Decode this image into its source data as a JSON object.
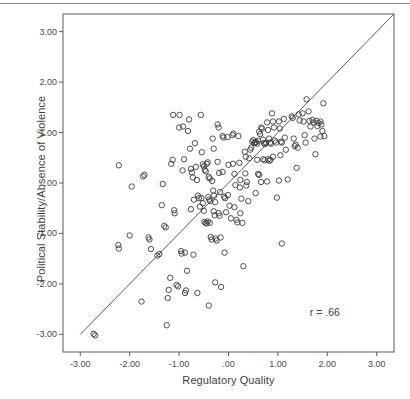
{
  "figure": {
    "background_color": "#ffffff",
    "frame_color": "#5a5a5a",
    "marker_color": "#3c3c3c",
    "line_color": "#4a4a4a",
    "top_rule": true
  },
  "chart_data": {
    "type": "scatter",
    "title": "",
    "xlabel": "Regulatory Quality",
    "ylabel": "Political Stability/Absence of Violence",
    "xlim": [
      -3.35,
      3.35
    ],
    "ylim": [
      -3.35,
      3.35
    ],
    "grid": false,
    "legend": null,
    "xticks": [
      -3.0,
      -2.0,
      -1.0,
      0.0,
      1.0,
      2.0,
      3.0
    ],
    "xticklabels": [
      "-3.00",
      "-2.00",
      "-1.00",
      ".00",
      "1.00",
      "2.00",
      "3.00"
    ],
    "yticks": [
      -3.0,
      -2.0,
      -1.0,
      0.0,
      1.0,
      2.0,
      3.0
    ],
    "yticklabels": [
      "-3.00",
      "-2.00",
      "-1.00",
      ".00",
      "1.00",
      "2.00",
      "3.00"
    ],
    "annotations": [
      {
        "text": "r = .66",
        "x": 1.95,
        "y": -2.55
      }
    ],
    "fit_line": {
      "type": "linear",
      "slope": 1.0,
      "intercept": 0.0,
      "x_start": -3.0,
      "y_start": -3.0,
      "x_end": 3.35,
      "y_end": 3.35
    },
    "marker": {
      "shape": "circle",
      "filled": false,
      "radius_px": 2.7
    },
    "points": [
      [
        -2.73,
        -2.99
      ],
      [
        -2.7,
        -3.02
      ],
      [
        -2.22,
        0.35
      ],
      [
        -1.96,
        -0.07
      ],
      [
        -2.23,
        -1.23
      ],
      [
        -2.22,
        -1.3
      ],
      [
        -2.0,
        -1.04
      ],
      [
        -1.76,
        -2.35
      ],
      [
        -1.73,
        0.13
      ],
      [
        -1.7,
        0.16
      ],
      [
        -1.62,
        -1.08
      ],
      [
        -1.6,
        -1.12
      ],
      [
        -1.57,
        -1.31
      ],
      [
        -1.44,
        -1.44
      ],
      [
        -1.4,
        -1.41
      ],
      [
        -1.33,
        -0.02
      ],
      [
        -1.35,
        -0.44
      ],
      [
        -1.3,
        -0.85
      ],
      [
        -1.27,
        -0.88
      ],
      [
        -1.25,
        -2.82
      ],
      [
        -1.21,
        -2.12
      ],
      [
        -1.23,
        -2.28
      ],
      [
        -1.16,
        0.38
      ],
      [
        -1.13,
        0.46
      ],
      [
        -1.1,
        -0.54
      ],
      [
        -1.09,
        -0.6
      ],
      [
        -1.12,
        1.35
      ],
      [
        -1.18,
        -1.88
      ],
      [
        -1.05,
        -2.02
      ],
      [
        -1.02,
        -2.05
      ],
      [
        -0.99,
        1.35
      ],
      [
        -1.0,
        1.1
      ],
      [
        -0.96,
        -1.35
      ],
      [
        -0.95,
        -1.4
      ],
      [
        -0.92,
        1.12
      ],
      [
        -0.9,
        0.47
      ],
      [
        -0.93,
        0.25
      ],
      [
        -0.88,
        -1.38
      ],
      [
        -0.86,
        -2.13
      ],
      [
        -0.88,
        -2.18
      ],
      [
        -0.84,
        -1.74
      ],
      [
        -0.8,
        1.26
      ],
      [
        -0.82,
        1.03
      ],
      [
        -0.78,
        0.68
      ],
      [
        -0.76,
        0.28
      ],
      [
        -0.74,
        0.21
      ],
      [
        -0.72,
        0.11
      ],
      [
        -0.7,
        -0.33
      ],
      [
        -0.76,
        -0.52
      ],
      [
        -0.71,
        -1.42
      ],
      [
        -0.68,
        0.79
      ],
      [
        -0.66,
        0.32
      ],
      [
        -0.64,
        0.06
      ],
      [
        -0.62,
        -0.25
      ],
      [
        -0.6,
        -0.3
      ],
      [
        -0.58,
        -0.47
      ],
      [
        -0.63,
        -2.18
      ],
      [
        -0.56,
        1.35
      ],
      [
        -0.54,
        0.61
      ],
      [
        -0.52,
        0.37
      ],
      [
        -0.5,
        0.33
      ],
      [
        -0.48,
        0.26
      ],
      [
        -0.46,
        0.23
      ],
      [
        -0.55,
        -0.3
      ],
      [
        -0.52,
        -0.4
      ],
      [
        -0.5,
        -0.55
      ],
      [
        -0.49,
        -0.77
      ],
      [
        -0.46,
        -0.79
      ],
      [
        -0.44,
        -0.8
      ],
      [
        -0.42,
        0.41
      ],
      [
        -0.44,
        0.38
      ],
      [
        -0.4,
        0.12
      ],
      [
        -0.38,
        0.09
      ],
      [
        -0.41,
        -0.28
      ],
      [
        -0.39,
        -0.33
      ],
      [
        -0.37,
        -0.36
      ],
      [
        -0.42,
        -0.76
      ],
      [
        -0.38,
        -0.79
      ],
      [
        -0.36,
        -1.07
      ],
      [
        -0.34,
        -1.12
      ],
      [
        -0.4,
        -2.43
      ],
      [
        -0.32,
        0.88
      ],
      [
        -0.3,
        0.68
      ],
      [
        -0.33,
        0.04
      ],
      [
        -0.31,
        -0.15
      ],
      [
        -0.29,
        -0.25
      ],
      [
        -0.27,
        -0.38
      ],
      [
        -0.3,
        -0.56
      ],
      [
        -0.28,
        -0.64
      ],
      [
        -0.26,
        -1.1
      ],
      [
        -0.24,
        -1.14
      ],
      [
        -0.27,
        -1.97
      ],
      [
        -0.22,
        1.16
      ],
      [
        -0.2,
        1.1
      ],
      [
        -0.22,
        0.42
      ],
      [
        -0.19,
        0.2
      ],
      [
        -0.17,
        -0.18
      ],
      [
        -0.2,
        -0.6
      ],
      [
        -0.18,
        -0.65
      ],
      [
        -0.16,
        -1.08
      ],
      [
        -0.15,
        -2.06
      ],
      [
        -0.12,
        0.93
      ],
      [
        -0.1,
        0.9
      ],
      [
        -0.12,
        0.22
      ],
      [
        -0.09,
        -0.27
      ],
      [
        -0.07,
        -0.3
      ],
      [
        -0.05,
        -0.58
      ],
      [
        -0.08,
        -1.38
      ],
      [
        -0.02,
        0.91
      ],
      [
        0.0,
        0.36
      ],
      [
        -0.01,
        -0.24
      ],
      [
        0.02,
        -0.45
      ],
      [
        0.05,
        -0.7
      ],
      [
        0.08,
        0.95
      ],
      [
        0.1,
        0.98
      ],
      [
        0.09,
        0.38
      ],
      [
        0.12,
        0.18
      ],
      [
        0.14,
        -0.04
      ],
      [
        0.12,
        -0.48
      ],
      [
        0.16,
        -0.73
      ],
      [
        0.18,
        -0.78
      ],
      [
        0.2,
        0.93
      ],
      [
        0.22,
        0.4
      ],
      [
        0.24,
        0.06
      ],
      [
        0.23,
        -0.09
      ],
      [
        0.26,
        -0.31
      ],
      [
        0.24,
        -0.6
      ],
      [
        0.28,
        -0.79
      ],
      [
        0.3,
        -1.65
      ],
      [
        0.33,
        0.62
      ],
      [
        0.35,
        0.52
      ],
      [
        0.34,
        0.19
      ],
      [
        0.37,
        0.02
      ],
      [
        0.36,
        -0.05
      ],
      [
        0.4,
        -0.36
      ],
      [
        0.42,
        0.49
      ],
      [
        0.44,
        0.66
      ],
      [
        0.46,
        0.7
      ],
      [
        0.48,
        0.82
      ],
      [
        0.5,
        0.85
      ],
      [
        0.52,
        0.79
      ],
      [
        0.54,
        0.8
      ],
      [
        0.56,
        0.81
      ],
      [
        0.58,
        0.78
      ],
      [
        0.6,
        0.84
      ],
      [
        0.62,
        1.02
      ],
      [
        0.64,
        0.97
      ],
      [
        0.58,
        0.46
      ],
      [
        0.6,
        0.18
      ],
      [
        0.62,
        0.16
      ],
      [
        0.55,
        -0.2
      ],
      [
        0.66,
        1.1
      ],
      [
        0.68,
        1.08
      ],
      [
        0.7,
        0.86
      ],
      [
        0.72,
        0.79
      ],
      [
        0.74,
        0.77
      ],
      [
        0.76,
        0.8
      ],
      [
        0.7,
        0.47
      ],
      [
        0.73,
        0.45
      ],
      [
        0.66,
        0.02
      ],
      [
        0.78,
        1.2
      ],
      [
        0.8,
        1.05
      ],
      [
        0.82,
        0.88
      ],
      [
        0.84,
        0.8
      ],
      [
        0.86,
        0.78
      ],
      [
        0.8,
        0.47
      ],
      [
        0.83,
        0.44
      ],
      [
        0.85,
        0.46
      ],
      [
        0.78,
        0.03
      ],
      [
        0.88,
        1.38
      ],
      [
        0.9,
        1.22
      ],
      [
        0.92,
        1.1
      ],
      [
        0.94,
        0.84
      ],
      [
        0.96,
        0.8
      ],
      [
        0.9,
        0.52
      ],
      [
        0.98,
        -0.29
      ],
      [
        1.02,
        1.22
      ],
      [
        1.04,
        1.08
      ],
      [
        1.06,
        0.82
      ],
      [
        1.08,
        0.8
      ],
      [
        1.05,
        0.55
      ],
      [
        1.02,
        0.05
      ],
      [
        1.08,
        -1.2
      ],
      [
        1.12,
        1.27
      ],
      [
        1.14,
        0.9
      ],
      [
        1.16,
        0.66
      ],
      [
        1.2,
        0.07
      ],
      [
        1.28,
        1.32
      ],
      [
        1.3,
        1.29
      ],
      [
        1.32,
        0.88
      ],
      [
        1.34,
        0.73
      ],
      [
        1.36,
        0.76
      ],
      [
        1.42,
        1.36
      ],
      [
        1.44,
        1.24
      ],
      [
        1.4,
        0.7
      ],
      [
        1.38,
        0.3
      ],
      [
        1.5,
        1.38
      ],
      [
        1.52,
        1.22
      ],
      [
        1.54,
        0.95
      ],
      [
        1.56,
        0.8
      ],
      [
        1.58,
        1.66
      ],
      [
        1.62,
        1.42
      ],
      [
        1.64,
        1.23
      ],
      [
        1.66,
        1.12
      ],
      [
        1.7,
        1.25
      ],
      [
        1.72,
        1.2
      ],
      [
        1.74,
        0.88
      ],
      [
        1.78,
        1.23
      ],
      [
        1.8,
        1.13
      ],
      [
        1.82,
        1.19
      ],
      [
        1.76,
        0.57
      ],
      [
        1.86,
        1.22
      ],
      [
        1.88,
        1.16
      ],
      [
        1.9,
        1.03
      ],
      [
        1.86,
        0.92
      ],
      [
        1.92,
        1.58
      ],
      [
        1.94,
        0.93
      ]
    ]
  }
}
